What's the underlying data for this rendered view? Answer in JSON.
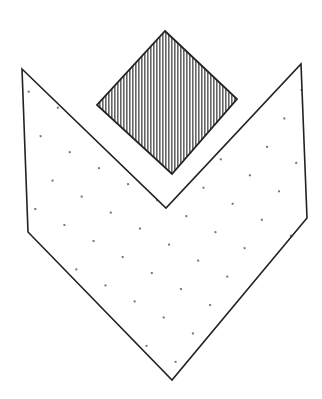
{
  "figure": {
    "width": 322,
    "height": 399,
    "background": "#ffffff",
    "stroke_color": "#222222",
    "chevron": {
      "name": "dotted-chevron-shape",
      "fill_pattern": "dots",
      "points": "22,69 166,208 301,64 307,218 172,380 28,232"
    },
    "diamond": {
      "name": "hatched-diamond-shape",
      "fill_pattern": "vertical-hatch",
      "points": "165,31 237,99 172,174 97,105"
    }
  }
}
